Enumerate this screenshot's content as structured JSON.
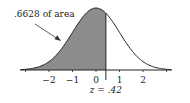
{
  "chart_data": {
    "type": "area",
    "title": "",
    "distribution": "standard normal",
    "xlabel": "",
    "ylabel": "",
    "xlim": [
      -3,
      3
    ],
    "x_ticks": [
      -2,
      -1,
      0,
      1,
      2
    ],
    "x_tick_labels": [
      "−2",
      "−1",
      "0",
      "1",
      "2"
    ],
    "shaded_region": {
      "from": "-inf",
      "to": 0.42,
      "area": 0.6628
    },
    "annotations": {
      "area_label": ".6628 of area",
      "z_label": "z = .42"
    },
    "z_value": 0.42,
    "grid": false,
    "legend": "none"
  },
  "colors": {
    "shade": "#8c8c8c",
    "curve": "#222222",
    "axis": "#222222"
  }
}
